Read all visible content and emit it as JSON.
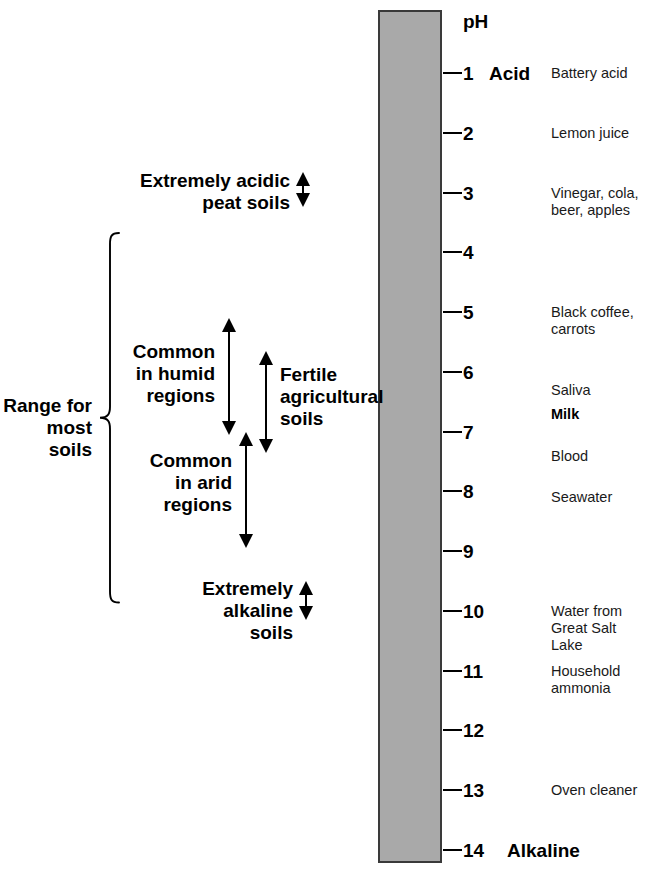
{
  "figure": {
    "type": "ph-scale-diagram",
    "header": "pH",
    "bar_color": "#a9a9a9",
    "axis": {
      "min": 1,
      "max": 14,
      "step": 1
    },
    "endpoints": {
      "acid": "Acid",
      "alkaline": "Alkaline"
    }
  },
  "scale": {
    "ticks": [
      {
        "value": "1",
        "ph": 1,
        "endpoint": "Acid"
      },
      {
        "value": "2",
        "ph": 2,
        "endpoint": ""
      },
      {
        "value": "3",
        "ph": 3,
        "endpoint": ""
      },
      {
        "value": "4",
        "ph": 4,
        "endpoint": ""
      },
      {
        "value": "5",
        "ph": 5,
        "endpoint": ""
      },
      {
        "value": "6",
        "ph": 6,
        "endpoint": ""
      },
      {
        "value": "7",
        "ph": 7,
        "endpoint": ""
      },
      {
        "value": "8",
        "ph": 8,
        "endpoint": ""
      },
      {
        "value": "9",
        "ph": 9,
        "endpoint": ""
      },
      {
        "value": "10",
        "ph": 10,
        "endpoint": ""
      },
      {
        "value": "11",
        "ph": 11,
        "endpoint": ""
      },
      {
        "value": "12",
        "ph": 12,
        "endpoint": ""
      },
      {
        "value": "13",
        "ph": 13,
        "endpoint": ""
      },
      {
        "value": "14",
        "ph": 14,
        "endpoint": "Alkaline"
      }
    ]
  },
  "substances": [
    {
      "label": "Battery acid",
      "ph": 1,
      "bold": false
    },
    {
      "label": "Lemon juice",
      "ph": 2,
      "bold": false
    },
    {
      "label": "Vinegar, cola,\nbeer, apples",
      "ph": 3,
      "bold": false
    },
    {
      "label": "Black coffee,\ncarrots",
      "ph": 5,
      "bold": false
    },
    {
      "label": "Saliva",
      "ph": 6.3,
      "bold": false
    },
    {
      "label": "Milk",
      "ph": 6.7,
      "bold": true
    },
    {
      "label": "Blood",
      "ph": 7.4,
      "bold": false
    },
    {
      "label": "Seawater",
      "ph": 8.1,
      "bold": false
    },
    {
      "label": "Water from\nGreat Salt\nLake",
      "ph": 10,
      "bold": false
    },
    {
      "label": "Household\nammonia",
      "ph": 11,
      "bold": false
    },
    {
      "label": "Oven cleaner",
      "ph": 13,
      "bold": false
    }
  ],
  "annotations": [
    {
      "id": "extremely-acidic-peat-soils",
      "label": "Extremely acidic\npeat soils",
      "range_low_ph": 2.65,
      "range_high_ph": 3.25
    },
    {
      "id": "common-in-humid-regions",
      "label": "Common\nin humid\nregions",
      "range_low_ph": 5.1,
      "range_high_ph": 7.05
    },
    {
      "id": "common-in-arid-regions",
      "label": "Common\nin arid\nregions",
      "range_low_ph": 7.0,
      "range_high_ph": 8.95
    },
    {
      "id": "fertile-agricultural-soils",
      "label": "Fertile\nagricultural\nsoils",
      "range_low_ph": 5.65,
      "range_high_ph": 7.35
    },
    {
      "id": "extremely-alkaline-soils",
      "label": "Extremely\nalkaline\nsoils",
      "range_low_ph": 9.5,
      "range_high_ph": 10.15
    }
  ],
  "bracket": {
    "id": "range-for-most-soils",
    "label": "Range for\nmost soils",
    "range_low_ph": 3.65,
    "range_high_ph": 9.9
  }
}
